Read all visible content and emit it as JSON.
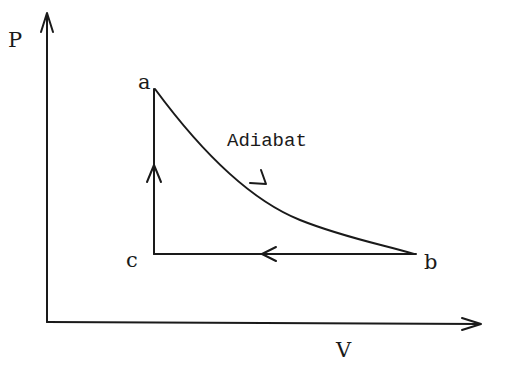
{
  "diagram": {
    "type": "P-V cycle diagram",
    "axes": {
      "y_label": "P",
      "x_label": "V"
    },
    "points": [
      {
        "id": "a",
        "label": "a"
      },
      {
        "id": "b",
        "label": "b"
      },
      {
        "id": "c",
        "label": "c"
      }
    ],
    "processes": [
      {
        "from": "a",
        "to": "b",
        "label": "Adiabat",
        "shape": "curve"
      },
      {
        "from": "b",
        "to": "c",
        "label": "",
        "shape": "horizontal line"
      },
      {
        "from": "c",
        "to": "a",
        "label": "",
        "shape": "vertical line"
      }
    ],
    "colors": {
      "ink": "#1a1a1a",
      "background": "#ffffff"
    }
  }
}
